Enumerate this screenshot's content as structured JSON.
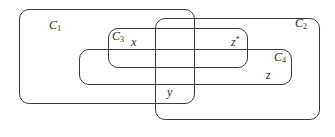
{
  "diagram": {
    "sets": [
      {
        "id": "C1",
        "base": "C",
        "sub": "1"
      },
      {
        "id": "C2",
        "base": "C",
        "sub": "2"
      },
      {
        "id": "C3",
        "base": "C",
        "sub": "3"
      },
      {
        "id": "C4",
        "base": "C",
        "sub": "4"
      }
    ],
    "points": [
      {
        "id": "x",
        "label": "x"
      },
      {
        "id": "y",
        "label": "y"
      },
      {
        "id": "z",
        "label": "z"
      },
      {
        "id": "z_star",
        "label": "z",
        "sup": "*"
      }
    ],
    "colors": {
      "stroke": "#3a3a3a",
      "text": "#2a2a2a",
      "background": "#ffffff"
    }
  }
}
